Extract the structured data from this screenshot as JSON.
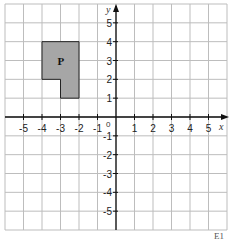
{
  "diagram": {
    "type": "coordinate-grid",
    "x_axis_label": "x",
    "y_axis_label": "y",
    "origin_label": "0",
    "x_ticks": [
      "-5",
      "-4",
      "-3",
      "-2",
      "-1",
      "1",
      "2",
      "3",
      "4",
      "5"
    ],
    "y_ticks": [
      "5",
      "4",
      "3",
      "2",
      "1",
      "-1",
      "-2",
      "-3",
      "-4",
      "-5"
    ],
    "x_range": [
      -6,
      6
    ],
    "y_range": [
      -6,
      6
    ],
    "shape": {
      "label": "P",
      "fill": "#a6a6a6",
      "vertices": [
        [
          -4,
          4
        ],
        [
          -2,
          4
        ],
        [
          -2,
          1
        ],
        [
          -3,
          1
        ],
        [
          -3,
          2
        ],
        [
          -4,
          2
        ]
      ]
    },
    "grid_color": "#bdbdbd",
    "axis_color": "#111111"
  },
  "footer": {
    "text": "E1"
  }
}
